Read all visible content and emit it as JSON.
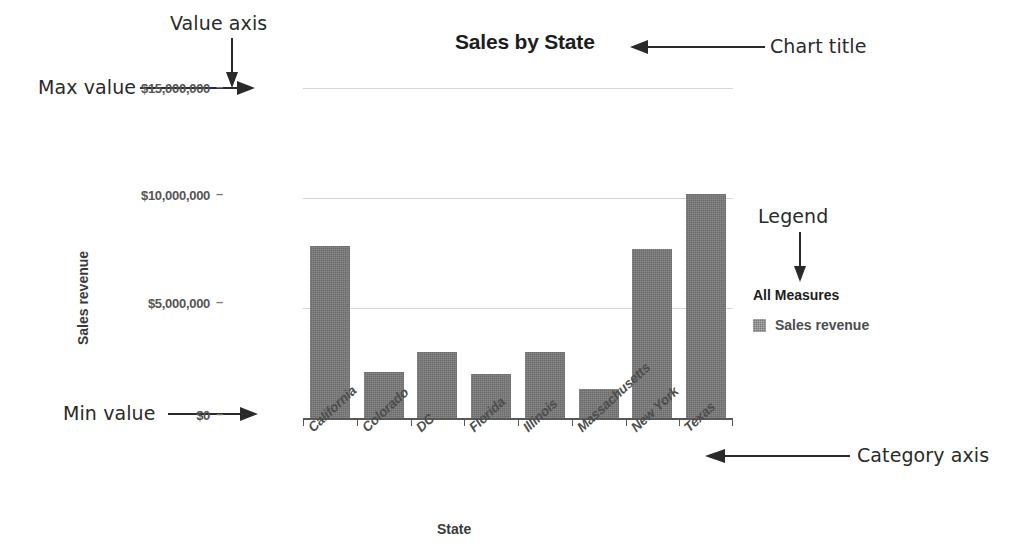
{
  "chart_data": {
    "type": "bar",
    "title": "Sales by State",
    "xlabel": "State",
    "ylabel": "Sales revenue",
    "categories": [
      "California",
      "Colorado",
      "DC",
      "Florida",
      "Illinois",
      "Massachusetts",
      "New York",
      "Texas"
    ],
    "values": [
      7800000,
      2100000,
      3000000,
      2000000,
      3000000,
      1300000,
      7700000,
      10200000
    ],
    "series": [
      {
        "name": "Sales revenue",
        "values": [
          7800000,
          2100000,
          3000000,
          2000000,
          3000000,
          1300000,
          7700000,
          10200000
        ]
      }
    ],
    "ylim": [
      0,
      15000000
    ],
    "ytick_values": [
      0,
      5000000,
      10000000,
      15000000
    ],
    "ytick_labels": [
      "$0",
      "$5,000,000",
      "$10,000,000",
      "$15,000,000"
    ],
    "grid": true,
    "legend_position": "right",
    "legend_title": "All Measures",
    "bar_color": "#6b6b6b",
    "gridline_color": "#d7d7d7"
  },
  "annotations": [
    {
      "id": "value-axis",
      "label": "Value axis"
    },
    {
      "id": "chart-title",
      "label": "Chart title"
    },
    {
      "id": "max-value",
      "label": "Max value"
    },
    {
      "id": "min-value",
      "label": "Min value"
    },
    {
      "id": "legend",
      "label": "Legend"
    },
    {
      "id": "category-axis",
      "label": "Category axis"
    }
  ]
}
